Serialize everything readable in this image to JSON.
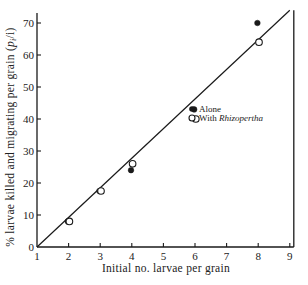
{
  "chart_data": {
    "type": "scatter",
    "title": "",
    "xlabel": "Initial no. larvae per grain",
    "ylabel": "% larvae killed and migrating per grain (p_i/i)",
    "ylabel_parts": {
      "text": "% larvae killed and migrating per grain (",
      "math": "p",
      "sub": "i",
      "tail": "/i)"
    },
    "xlim": [
      1,
      9
    ],
    "ylim": [
      0,
      75
    ],
    "x_ticks": [
      1,
      2,
      3,
      4,
      5,
      6,
      7,
      8,
      9
    ],
    "y_ticks": [
      0,
      10,
      20,
      30,
      40,
      50,
      60,
      70
    ],
    "grid": false,
    "legend_position": "inside, center-right",
    "series": [
      {
        "name": "Alone",
        "marker": "filled-circle",
        "x": [
          2,
          3,
          4,
          6,
          8
        ],
        "y": [
          8,
          17.5,
          24,
          43,
          70
        ]
      },
      {
        "name": "With Rhizopertha",
        "marker": "open-circle",
        "x": [
          2,
          3,
          4,
          6,
          8
        ],
        "y": [
          8,
          17.5,
          26,
          40,
          64
        ]
      }
    ],
    "fit_line": {
      "x": [
        1,
        9
      ],
      "y": [
        0,
        74
      ]
    }
  },
  "legend": {
    "alone_label": "Alone",
    "with_prefix": "With ",
    "with_italic": "Rhizopertha"
  },
  "colors": {
    "ink": "#1a1a1a",
    "background": "#ffffff"
  }
}
